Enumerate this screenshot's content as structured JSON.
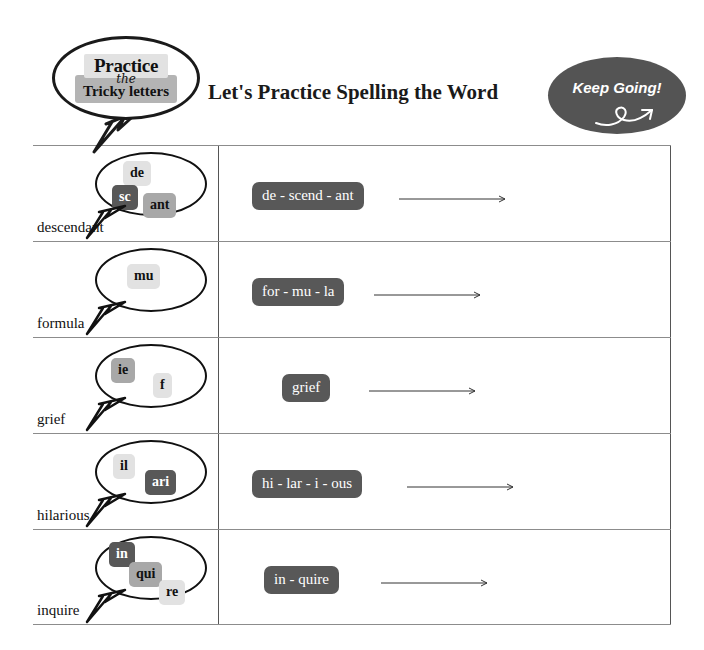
{
  "header": {
    "logo": {
      "line1": "Practice",
      "connector": "the",
      "line2": "Tricky letters"
    },
    "title": "Let's  Practice Spelling the Word",
    "badge": {
      "label": "Keep Going!",
      "color": "#545454"
    }
  },
  "colors": {
    "chip_dark": "#585858",
    "chip_mid": "#a8a8a8",
    "chip_light": "#e2e2e2",
    "line": "#8c8c8c",
    "text": "#111111"
  },
  "rows": [
    {
      "word": "descendant",
      "chips": [
        {
          "text": "de",
          "shade": "light",
          "x": 26,
          "y": 7
        },
        {
          "text": "sc",
          "shade": "dark",
          "x": 15,
          "y": 31
        },
        {
          "text": "ant",
          "shade": "mid",
          "x": 46,
          "y": 39
        }
      ],
      "answer": "de - scend - ant",
      "answer_x": 33,
      "arrow_x": 180,
      "arrow_w": 112
    },
    {
      "word": "formula",
      "chips": [
        {
          "text": "mu",
          "shade": "light",
          "x": 30,
          "y": 14
        }
      ],
      "answer": "for - mu - la",
      "answer_x": 33,
      "arrow_x": 155,
      "arrow_w": 112
    },
    {
      "word": "grief",
      "chips": [
        {
          "text": "ie",
          "shade": "mid",
          "x": 14,
          "y": 12
        },
        {
          "text": "f",
          "shade": "light",
          "x": 56,
          "y": 27
        }
      ],
      "answer": "grief",
      "answer_x": 63,
      "arrow_x": 150,
      "arrow_w": 112
    },
    {
      "word": "hilarious",
      "chips": [
        {
          "text": "il",
          "shade": "light",
          "x": 16,
          "y": 12
        },
        {
          "text": "ari",
          "shade": "dark",
          "x": 48,
          "y": 28
        }
      ],
      "answer": "hi - lar - i - ous",
      "answer_x": 33,
      "arrow_x": 188,
      "arrow_w": 112
    },
    {
      "word": "inquire",
      "chips": [
        {
          "text": "in",
          "shade": "dark",
          "x": 12,
          "y": 4
        },
        {
          "text": "qui",
          "shade": "mid",
          "x": 32,
          "y": 24
        },
        {
          "text": "re",
          "shade": "light",
          "x": 62,
          "y": 42
        }
      ],
      "answer": "in - quire",
      "answer_x": 45,
      "arrow_x": 162,
      "arrow_w": 112
    }
  ]
}
